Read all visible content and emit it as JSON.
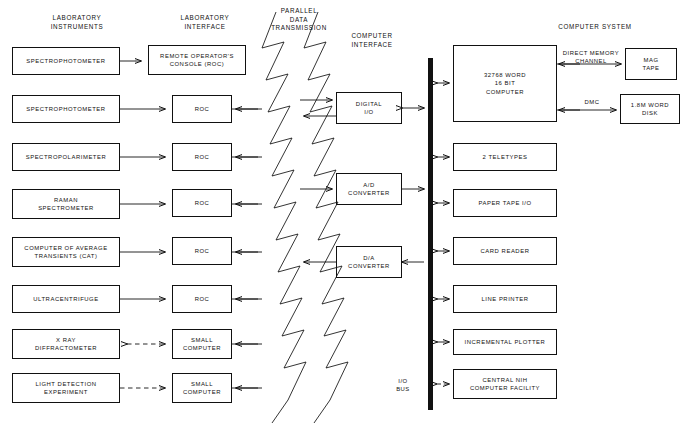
{
  "diagram": {
    "column_headers": [
      {
        "id": "lab-instruments",
        "label": "LABORATORY\nINSTRUMENTS",
        "x": 18,
        "y": 14,
        "w": 118
      },
      {
        "id": "lab-interface",
        "label": "LABORATORY\nINTERFACE",
        "x": 150,
        "y": 14,
        "w": 110
      },
      {
        "id": "parallel-data-transmission",
        "label": "PARALLEL\nDATA\nTRANSMISSION",
        "x": 258,
        "y": 7,
        "w": 82
      },
      {
        "id": "computer-interface",
        "label": "COMPUTER\nINTERFACE",
        "x": 330,
        "y": 32,
        "w": 84
      },
      {
        "id": "computer-system",
        "label": "COMPUTER SYSTEM",
        "x": 540,
        "y": 23,
        "w": 110
      }
    ],
    "instruments": [
      {
        "id": "spectrophotometer-1",
        "label": "SPECTROPHOTOMETER",
        "x": 12,
        "y": 47,
        "w": 108,
        "h": 28
      },
      {
        "id": "spectrophotometer-2",
        "label": "SPECTROPHOTOMETER",
        "x": 12,
        "y": 95,
        "w": 108,
        "h": 28
      },
      {
        "id": "spectropolarimeter",
        "label": "SPECTROPOLARIMETER",
        "x": 12,
        "y": 143,
        "w": 108,
        "h": 28
      },
      {
        "id": "raman-spectrometer",
        "label": "RAMAN\nSPECTROMETER",
        "x": 12,
        "y": 189,
        "w": 108,
        "h": 30
      },
      {
        "id": "computer-of-average-transients",
        "label": "COMPUTER OF AVERAGE\nTRANSIENTS (CAT)",
        "x": 12,
        "y": 237,
        "w": 108,
        "h": 30
      },
      {
        "id": "ultracentrifuge",
        "label": "ULTRACENTRIFUGE",
        "x": 12,
        "y": 285,
        "w": 108,
        "h": 28
      },
      {
        "id": "x-ray-diffractometer",
        "label": "X RAY\nDIFFRACTOMETER",
        "x": 12,
        "y": 329,
        "w": 108,
        "h": 30
      },
      {
        "id": "light-detection-experiment",
        "label": "LIGHT DETECTION\nEXPERIMENT",
        "x": 12,
        "y": 373,
        "w": 108,
        "h": 30
      }
    ],
    "interfaces": [
      {
        "id": "remote-operators-console",
        "label": "REMOTE OPERATOR'S\nCONSOLE (ROC)",
        "x": 148,
        "y": 45,
        "w": 98,
        "h": 30
      },
      {
        "id": "roc-2",
        "label": "ROC",
        "x": 172,
        "y": 95,
        "w": 60,
        "h": 28
      },
      {
        "id": "roc-3",
        "label": "ROC",
        "x": 172,
        "y": 143,
        "w": 60,
        "h": 28
      },
      {
        "id": "roc-4",
        "label": "ROC",
        "x": 172,
        "y": 189,
        "w": 60,
        "h": 28
      },
      {
        "id": "roc-5",
        "label": "ROC",
        "x": 172,
        "y": 237,
        "w": 60,
        "h": 28
      },
      {
        "id": "roc-6",
        "label": "ROC",
        "x": 172,
        "y": 285,
        "w": 60,
        "h": 28
      },
      {
        "id": "small-computer-1",
        "label": "SMALL\nCOMPUTER",
        "x": 172,
        "y": 329,
        "w": 60,
        "h": 30
      },
      {
        "id": "small-computer-2",
        "label": "SMALL\nCOMPUTER",
        "x": 172,
        "y": 373,
        "w": 60,
        "h": 30
      }
    ],
    "computer_interface_boxes": [
      {
        "id": "digital-io",
        "label": "DIGITAL\nI/O",
        "x": 336,
        "y": 92,
        "w": 66,
        "h": 32
      },
      {
        "id": "ad-converter",
        "label": "A/D\nCONVERTER",
        "x": 336,
        "y": 173,
        "w": 66,
        "h": 32
      },
      {
        "id": "da-converter",
        "label": "D/A\nCONVERTER",
        "x": 336,
        "y": 246,
        "w": 66,
        "h": 32
      }
    ],
    "computer": {
      "id": "main-computer",
      "label": "32768 WORD\n16 BIT\nCOMPUTER",
      "x": 453,
      "y": 45,
      "w": 104,
      "h": 77
    },
    "storage": [
      {
        "id": "mag-tape",
        "label": "MAG\nTAPE",
        "x": 625,
        "y": 48,
        "w": 52,
        "h": 32
      },
      {
        "id": "word-disk",
        "label": "1.8M WORD\nDISK",
        "x": 620,
        "y": 94,
        "w": 60,
        "h": 30
      }
    ],
    "peripherals": [
      {
        "id": "teletypes",
        "label": "2 TELETYPES",
        "x": 453,
        "y": 143,
        "w": 104,
        "h": 28
      },
      {
        "id": "paper-tape-io",
        "label": "PAPER TAPE  I/O",
        "x": 453,
        "y": 189,
        "w": 104,
        "h": 28
      },
      {
        "id": "card-reader",
        "label": "CARD READER",
        "x": 453,
        "y": 237,
        "w": 104,
        "h": 28
      },
      {
        "id": "line-printer",
        "label": "LINE PRINTER",
        "x": 453,
        "y": 285,
        "w": 104,
        "h": 28
      },
      {
        "id": "incremental-plotter",
        "label": "INCREMENTAL PLOTTER",
        "x": 453,
        "y": 329,
        "w": 104,
        "h": 26
      },
      {
        "id": "central-nih-computer-facility",
        "label": "CENTRAL NIH\nCOMPUTER FACILITY",
        "x": 453,
        "y": 369,
        "w": 104,
        "h": 30
      }
    ],
    "bus": {
      "id": "io-bus",
      "label": "I/O\nBUS",
      "x": 428,
      "y": 58,
      "w": 5,
      "h": 352,
      "label_x": 396,
      "label_y": 377
    },
    "edge_labels": [
      {
        "id": "direct-memory-channel",
        "label": "DIRECT MEMORY\nCHANNEL",
        "x": 556,
        "y": 49,
        "w": 70
      },
      {
        "id": "dmc",
        "label": "DMC",
        "x": 575,
        "y": 98,
        "w": 34
      }
    ],
    "colors": {
      "ink": "#111111",
      "paper": "#ffffff",
      "bus_fill": "#111111"
    }
  }
}
